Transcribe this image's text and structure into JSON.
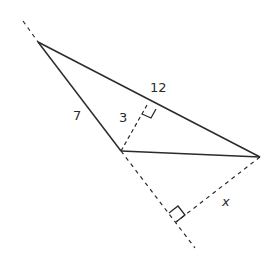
{
  "diagram": {
    "type": "geometry",
    "colors": {
      "line": "#2b2b2b",
      "background": "#ffffff"
    },
    "labels": {
      "side_AB": "7",
      "side_AC": "12",
      "height_to_AC": "3",
      "height_to_AB_ext": "x"
    }
  }
}
